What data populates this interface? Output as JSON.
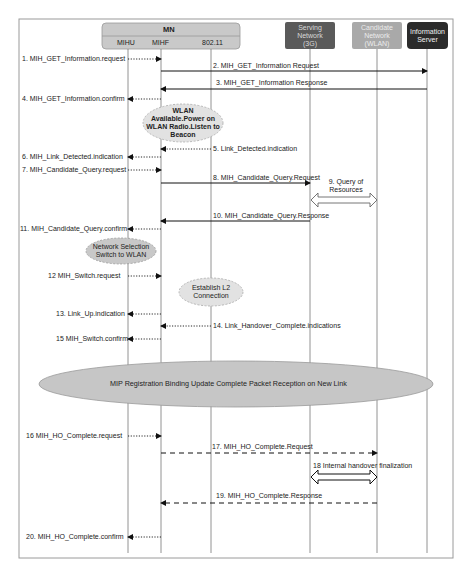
{
  "diagram": {
    "type": "sequence",
    "frame": {
      "x": 19,
      "y": 19,
      "width": 434,
      "height": 539,
      "border_color": "#9a9a9a"
    },
    "mn_group": {
      "title": "MN",
      "fill": "#c9c9c9",
      "border": "#9a9a9a"
    },
    "participants": [
      {
        "id": "mihu",
        "label": "MIHU",
        "x": 128,
        "group": "MN"
      },
      {
        "id": "mihf",
        "label": "MIHF",
        "x": 161,
        "group": "MN"
      },
      {
        "id": "wifi",
        "label": "802.11",
        "x": 211,
        "group": "MN"
      },
      {
        "id": "serving",
        "label": "Serving Network (3G)",
        "line1": "Serving",
        "line2": "Network",
        "line3": "(3G)",
        "x": 310,
        "fill": "#5a5a5a",
        "text_color": "#d8d8d8"
      },
      {
        "id": "candidate",
        "label": "Candidate Network (WLAN)",
        "line1": "Candidate",
        "line2": "Network",
        "line3": "(WLAN)",
        "x": 377,
        "fill": "#a9a9a9",
        "text_color": "#e6e6e6"
      },
      {
        "id": "infoserver",
        "label": "Information Server",
        "line1": "Information",
        "line2": "Server",
        "x": 427,
        "fill": "#2b2b2b",
        "text_color": "#f0f0f0"
      }
    ],
    "messages": [
      {
        "n": 1,
        "label": "1. MIH_GET_Information.request",
        "from": "mihu",
        "to": "mihf",
        "style": "dotted",
        "y": 59
      },
      {
        "n": 2,
        "label": "2. MIH_GET_Information Request",
        "from": "mihf",
        "to": "infoserver",
        "style": "solid",
        "y": 71
      },
      {
        "n": 3,
        "label": "3. MIH_GET_Information Response",
        "from": "infoserver",
        "to": "mihf",
        "style": "solid",
        "y": 89
      },
      {
        "n": 4,
        "label": "4. MIH_GET_Information.confirm",
        "from": "mihf",
        "to": "mihu",
        "style": "dotted",
        "y": 99
      },
      {
        "n": 5,
        "label": "5. Link_Detected.indication",
        "from": "wifi",
        "to": "mihf",
        "style": "dotted",
        "y": 149
      },
      {
        "n": 6,
        "label": "6. MIH_Link_Detected.indication",
        "from": "mihf",
        "to": "mihu",
        "style": "dotted",
        "y": 157
      },
      {
        "n": 7,
        "label": "7. MIH_Candidate_Query.request",
        "from": "mihu",
        "to": "mihf",
        "style": "dotted",
        "y": 170
      },
      {
        "n": 8,
        "label": "8. MIH_Candidate_Query.Request",
        "from": "mihf",
        "to": "serving",
        "style": "solid",
        "y": 183
      },
      {
        "n": 9,
        "label": "9. Query of Resources",
        "line1": "9. Query of",
        "line2": "Resources",
        "from": "serving",
        "to": "candidate",
        "style": "block-double",
        "y": 200
      },
      {
        "n": 10,
        "label": "10. MIH_Candidate_Query.Response",
        "from": "serving",
        "to": "mihf",
        "style": "solid",
        "y": 221
      },
      {
        "n": 11,
        "label": "11. MIH_Candidate_Query.confirm",
        "from": "mihf",
        "to": "mihu",
        "style": "dotted",
        "y": 229
      },
      {
        "n": 12,
        "label": "12 MIH_Switch.request",
        "from": "mihu",
        "to": "mihf",
        "style": "dotted",
        "y": 276
      },
      {
        "n": 13,
        "label": "13. Link_Up.indication",
        "from": "mihf",
        "to": "mihu",
        "style": "dotted",
        "y": 314
      },
      {
        "n": 14,
        "label": "14. Link_Handover_Complete.indications",
        "from": "wifi",
        "to": "mihf",
        "style": "dotted",
        "y": 326
      },
      {
        "n": 15,
        "label": "15 MIH_Switch.confirm",
        "from": "mihf",
        "to": "mihu",
        "style": "dotted",
        "y": 339
      },
      {
        "n": 16,
        "label": "16 MIH_HO_Complete.request",
        "from": "mihu",
        "to": "mihf",
        "style": "dotted",
        "y": 436
      },
      {
        "n": 17,
        "label": "17. MIH_HO_Complete.Request",
        "from": "mihf",
        "to": "candidate",
        "style": "dashed",
        "y": 453
      },
      {
        "n": 18,
        "label": "18 Internal handover finalization",
        "from": "serving",
        "to": "candidate",
        "style": "block-double",
        "y": 477
      },
      {
        "n": 19,
        "label": "19. MIH_HO_Complete.Response",
        "from": "candidate",
        "to": "mihf",
        "style": "dashed",
        "y": 503
      },
      {
        "n": 20,
        "label": "20. MIH_HO_Complete.confirm",
        "from": "mihf",
        "to": "mihu",
        "style": "dotted",
        "y": 537
      }
    ],
    "notes": [
      {
        "id": "wlan-available",
        "line1": "WLAN",
        "line2": "Available.Power on",
        "line3": "WLAN Radio.Listen to",
        "line4": "Beacon",
        "cx": 183,
        "cy": 123,
        "rx": 40,
        "ry": 19,
        "fill": "#e2e2e2",
        "border": "dashed",
        "bold": true
      },
      {
        "id": "network-selection",
        "line1": "Network Selection",
        "line2": "Switch to WLAN",
        "cx": 121,
        "cy": 251,
        "rx": 35,
        "ry": 13,
        "fill": "#c8c8c8",
        "border": "dashed"
      },
      {
        "id": "establish-l2",
        "line1": "Establish L2",
        "line2": "Connection",
        "cx": 211,
        "cy": 292,
        "rx": 32,
        "ry": 14,
        "fill": "#e2e2e2",
        "border": "dashed"
      },
      {
        "id": "mip-registration",
        "text": "MIP Registration Binding Update Complete Packet Reception on New Link",
        "cx": 236,
        "cy": 384,
        "rx": 197,
        "ry": 23,
        "fill": "#c6c6c6",
        "border": "solid"
      }
    ]
  }
}
